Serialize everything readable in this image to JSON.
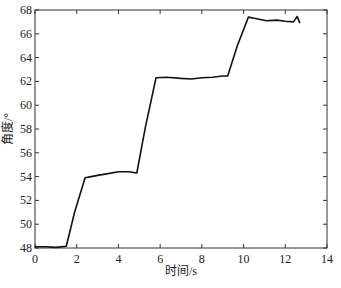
{
  "chart_data": {
    "type": "line",
    "title": "",
    "xlabel": "时间/s",
    "ylabel": "角度/°",
    "xlim": [
      0,
      14
    ],
    "ylim": [
      48,
      68
    ],
    "xticks": [
      0,
      2,
      4,
      6,
      8,
      10,
      12,
      14
    ],
    "yticks": [
      48,
      50,
      52,
      54,
      56,
      58,
      60,
      62,
      64,
      66,
      68
    ],
    "grid": false,
    "legend": null,
    "series": [
      {
        "name": "angle",
        "color": "#111111",
        "x": [
          0,
          0.5,
          1.0,
          1.5,
          1.9,
          2.4,
          2.7,
          3.0,
          3.5,
          4.0,
          4.5,
          4.88,
          5.3,
          5.8,
          6.3,
          7.0,
          7.5,
          8.0,
          8.5,
          9.0,
          9.24,
          9.7,
          10.23,
          10.5,
          11.1,
          11.6,
          12.0,
          12.4,
          12.57,
          12.7
        ],
        "y": [
          48.1,
          48.1,
          48.05,
          48.15,
          51.0,
          53.9,
          54.0,
          54.1,
          54.25,
          54.4,
          54.4,
          54.3,
          58.2,
          62.3,
          62.35,
          62.25,
          62.2,
          62.3,
          62.35,
          62.45,
          62.45,
          65.0,
          67.4,
          67.3,
          67.1,
          67.15,
          67.05,
          67.0,
          67.45,
          66.9
        ]
      }
    ]
  }
}
